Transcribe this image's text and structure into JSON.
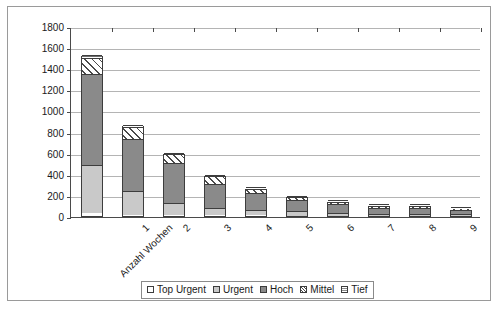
{
  "chart_data": {
    "type": "bar",
    "subtype": "stacked",
    "title": "",
    "xlabel": "Anzahl Wochen",
    "ylabel": "",
    "ylim": [
      0,
      1800
    ],
    "ytick_step": 200,
    "yticks": [
      "1800",
      "1600",
      "1400",
      "1200",
      "1000",
      "800",
      "600",
      "400",
      "200",
      "0"
    ],
    "grid": true,
    "legend_position": "bottom",
    "categories": [
      "Anzahl Wochen",
      "1",
      "2",
      "3",
      "4",
      "5",
      "6",
      "7",
      "8",
      "9"
    ],
    "series": [
      {
        "name": "Top Urgent",
        "color": "#ffffff",
        "pattern": "solid",
        "values": [
          30,
          10,
          8,
          5,
          5,
          4,
          3,
          2,
          2,
          2
        ]
      },
      {
        "name": "Urgent",
        "color": "#c9c9c9",
        "pattern": "solid",
        "values": [
          450,
          230,
          115,
          70,
          55,
          40,
          25,
          20,
          18,
          15
        ]
      },
      {
        "name": "Hoch",
        "color": "#8a8a8a",
        "pattern": "solid",
        "values": [
          870,
          490,
          375,
          230,
          155,
          105,
          85,
          55,
          60,
          40
        ]
      },
      {
        "name": "Mittel",
        "color": "#ffffff",
        "pattern": "diagonal-hatch",
        "values": [
          150,
          110,
          85,
          70,
          45,
          30,
          22,
          18,
          15,
          10
        ]
      },
      {
        "name": "Tief",
        "color": "#ffffff",
        "pattern": "horizontal-hatch",
        "values": [
          30,
          20,
          12,
          10,
          8,
          6,
          5,
          5,
          5,
          3
        ]
      }
    ],
    "totals": [
      1530,
      860,
      595,
      385,
      268,
      185,
      140,
      100,
      100,
      70
    ]
  },
  "legend": {
    "entries": [
      {
        "label": "Top Urgent"
      },
      {
        "label": "Urgent"
      },
      {
        "label": "Hoch"
      },
      {
        "label": "Mittel"
      },
      {
        "label": "Tief"
      }
    ]
  }
}
